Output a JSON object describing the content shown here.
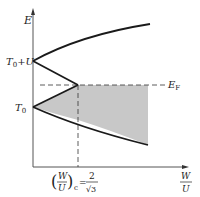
{
  "diagram": {
    "y_axis_label": "E",
    "x_axis_label_num": "W",
    "x_axis_label_den": "U",
    "labels": {
      "t0_plus_u": "T",
      "t0_plus_u_sub": "0",
      "t0_plus_u_rest": "+U",
      "t0": "T",
      "t0_sub": "0",
      "fermi": "E",
      "fermi_sub": "F"
    },
    "critical": {
      "num": "W",
      "den": "U",
      "sub": "c",
      "eq": "=",
      "val_num": "2",
      "val_den": "√3"
    },
    "colors": {
      "line": "#1a1a1a",
      "shade": "#c8c8c8",
      "dash": "#333333"
    }
  }
}
